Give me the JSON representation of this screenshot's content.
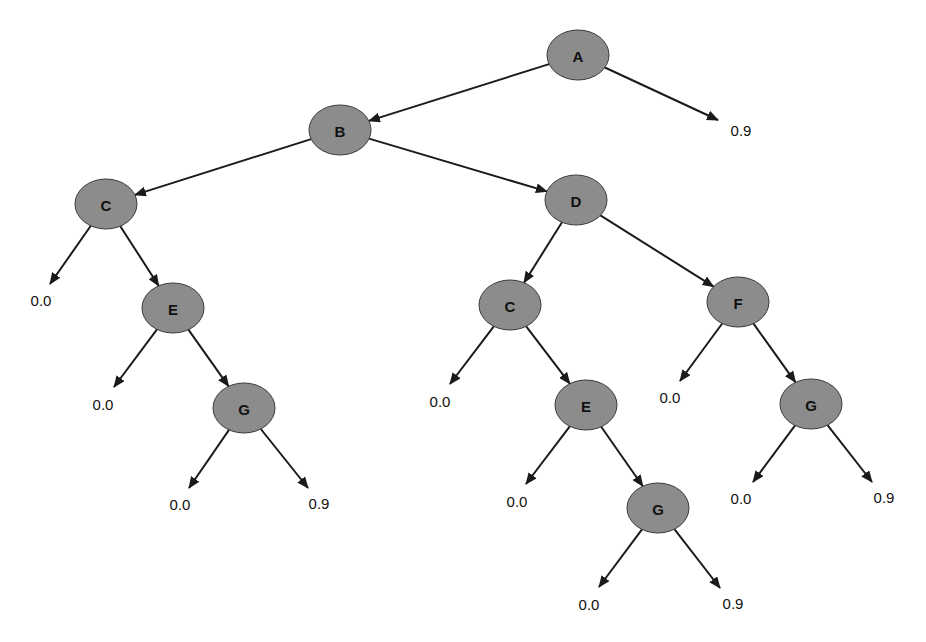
{
  "diagram": {
    "type": "decision-tree",
    "colors": {
      "node_fill": "#8c8c8c",
      "node_stroke": "#3a3a3a",
      "edge": "#1a1a1a",
      "text": "#111111",
      "background": "#ffffff"
    },
    "nodes": [
      {
        "id": "A",
        "label": "A",
        "cx": 578,
        "cy": 55,
        "rx": 31,
        "ry": 25
      },
      {
        "id": "B",
        "label": "B",
        "cx": 340,
        "cy": 130,
        "rx": 31,
        "ry": 25
      },
      {
        "id": "C1",
        "label": "C",
        "cx": 106,
        "cy": 204,
        "rx": 31,
        "ry": 25
      },
      {
        "id": "D",
        "label": "D",
        "cx": 576,
        "cy": 200,
        "rx": 31,
        "ry": 25
      },
      {
        "id": "E1",
        "label": "E",
        "cx": 173,
        "cy": 308,
        "rx": 31,
        "ry": 25
      },
      {
        "id": "G1",
        "label": "G",
        "cx": 244,
        "cy": 408,
        "rx": 31,
        "ry": 25
      },
      {
        "id": "C2",
        "label": "C",
        "cx": 510,
        "cy": 305,
        "rx": 31,
        "ry": 25
      },
      {
        "id": "F",
        "label": "F",
        "cx": 738,
        "cy": 302,
        "rx": 31,
        "ry": 25
      },
      {
        "id": "E2",
        "label": "E",
        "cx": 586,
        "cy": 405,
        "rx": 31,
        "ry": 25
      },
      {
        "id": "G2",
        "label": "G",
        "cx": 811,
        "cy": 404,
        "rx": 31,
        "ry": 25
      },
      {
        "id": "G3",
        "label": "G",
        "cx": 658,
        "cy": 508,
        "rx": 31,
        "ry": 25
      }
    ],
    "leaves": [
      {
        "id": "L_A",
        "label": "0.9",
        "x": 741,
        "y": 130,
        "ax": 718,
        "ay": 120
      },
      {
        "id": "L_C1",
        "label": "0.0",
        "x": 41,
        "y": 300,
        "ax": 50,
        "ay": 284
      },
      {
        "id": "L_E1",
        "label": "0.0",
        "x": 103,
        "y": 404,
        "ax": 114,
        "ay": 387
      },
      {
        "id": "L_G1a",
        "label": "0.0",
        "x": 180,
        "y": 504,
        "ax": 189,
        "ay": 488
      },
      {
        "id": "L_G1b",
        "label": "0.9",
        "x": 319,
        "y": 503,
        "ax": 308,
        "ay": 488
      },
      {
        "id": "L_C2",
        "label": "0.0",
        "x": 440,
        "y": 401,
        "ax": 450,
        "ay": 384
      },
      {
        "id": "L_E2",
        "label": "0.0",
        "x": 517,
        "y": 501,
        "ax": 526,
        "ay": 484
      },
      {
        "id": "L_G3a",
        "label": "0.0",
        "x": 589,
        "y": 604,
        "ax": 599,
        "ay": 587
      },
      {
        "id": "L_G3b",
        "label": "0.9",
        "x": 733,
        "y": 603,
        "ax": 720,
        "ay": 588
      },
      {
        "id": "L_F",
        "label": "0.0",
        "x": 670,
        "y": 397,
        "ax": 680,
        "ay": 381
      },
      {
        "id": "L_G2a",
        "label": "0.0",
        "x": 741,
        "y": 498,
        "ax": 753,
        "ay": 482
      },
      {
        "id": "L_G2b",
        "label": "0.9",
        "x": 884,
        "y": 497,
        "ax": 872,
        "ay": 482
      }
    ],
    "edges": [
      {
        "from": "A",
        "to": "B"
      },
      {
        "from": "A",
        "to": "L_A"
      },
      {
        "from": "B",
        "to": "C1"
      },
      {
        "from": "B",
        "to": "D"
      },
      {
        "from": "C1",
        "to": "L_C1"
      },
      {
        "from": "C1",
        "to": "E1"
      },
      {
        "from": "E1",
        "to": "L_E1"
      },
      {
        "from": "E1",
        "to": "G1"
      },
      {
        "from": "G1",
        "to": "L_G1a"
      },
      {
        "from": "G1",
        "to": "L_G1b"
      },
      {
        "from": "D",
        "to": "C2"
      },
      {
        "from": "D",
        "to": "F"
      },
      {
        "from": "C2",
        "to": "L_C2"
      },
      {
        "from": "C2",
        "to": "E2"
      },
      {
        "from": "E2",
        "to": "L_E2"
      },
      {
        "from": "E2",
        "to": "G3"
      },
      {
        "from": "G3",
        "to": "L_G3a"
      },
      {
        "from": "G3",
        "to": "L_G3b"
      },
      {
        "from": "F",
        "to": "L_F"
      },
      {
        "from": "F",
        "to": "G2"
      },
      {
        "from": "G2",
        "to": "L_G2a"
      },
      {
        "from": "G2",
        "to": "L_G2b"
      }
    ]
  }
}
